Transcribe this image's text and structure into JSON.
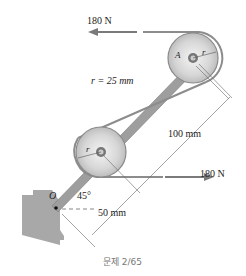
{
  "figure": {
    "force_top": "180 N",
    "force_bottom": "180 N",
    "radius_label": "r = 25 mm",
    "pulley_top_point": "A",
    "pulley_radius_symbol": "r",
    "pivot_point": "O",
    "angle": "45°",
    "dim_long": "100 mm",
    "dim_short": "50 mm",
    "caption": "문제 2/65"
  },
  "colors": {
    "belt": "#8a8a8a",
    "arm": "#9a9a9a",
    "pulley": "#d8d8d8",
    "ground": "#a8a8a8",
    "text": "#222222"
  }
}
